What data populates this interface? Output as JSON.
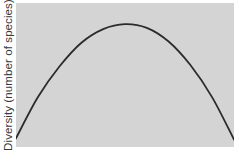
{
  "chart_data": {
    "type": "line",
    "title": "",
    "xlabel": "",
    "ylabel": "Diversity (number of species)",
    "x": [
      0,
      0.1,
      0.2,
      0.3,
      0.4,
      0.5,
      0.6,
      0.7,
      0.8,
      0.9,
      1.0
    ],
    "series": [
      {
        "name": "Diversity",
        "values": [
          0.07,
          0.4,
          0.65,
          0.84,
          0.95,
          0.99,
          0.96,
          0.85,
          0.66,
          0.4,
          0.06
        ]
      }
    ],
    "xlim": [
      0,
      1
    ],
    "ylim": [
      0,
      1.16
    ],
    "grid": false,
    "legend": null,
    "x_ticks": [],
    "y_ticks": [],
    "colors": {
      "background": "#d4d4d4",
      "line": "#2b2b2b"
    }
  }
}
